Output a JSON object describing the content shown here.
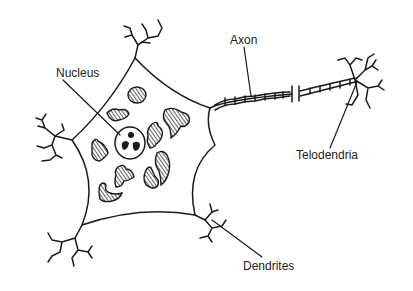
{
  "diagram": {
    "labels": {
      "nucleus": "Nucleus",
      "axon": "Axon",
      "telodendria": "Telodendria",
      "dendrites": "Dendrites"
    },
    "colors": {
      "line": "#1a1a1a",
      "background": "#ffffff"
    }
  }
}
